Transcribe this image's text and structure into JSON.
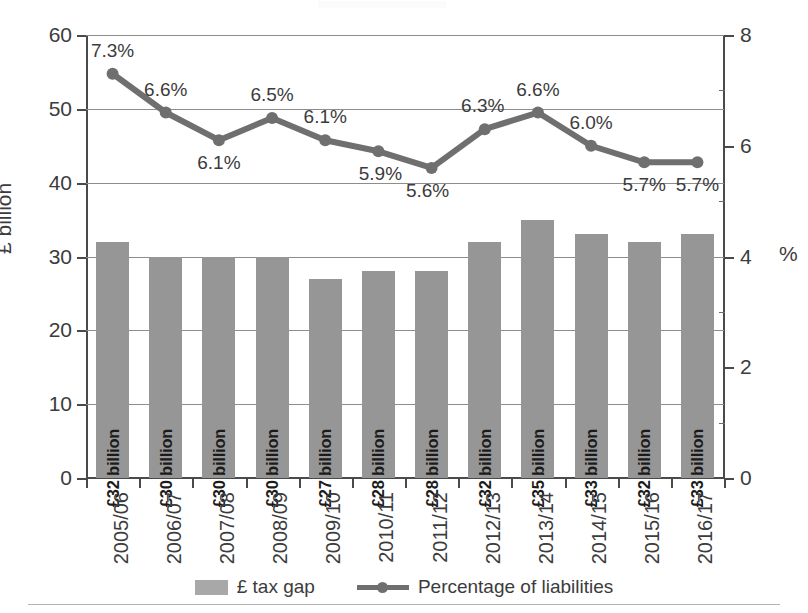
{
  "axes": {
    "left_title": "£ billion",
    "right_title": "%",
    "left_ticks": [
      "0",
      "10",
      "20",
      "30",
      "40",
      "50",
      "60"
    ],
    "right_ticks": [
      "0",
      "2",
      "4",
      "6",
      "8"
    ]
  },
  "legend": {
    "items": [
      {
        "label": "£ tax gap",
        "type": "bar",
        "color": "#a8a8a8"
      },
      {
        "label": "Percentage of liabilities",
        "type": "line",
        "color": "#6f6f6f"
      }
    ]
  },
  "chart_data": {
    "type": "bar",
    "title": "",
    "subtitle": "",
    "xlabel": "",
    "ylabel": "£ billion",
    "y2label": "%",
    "ylim": [
      0,
      60
    ],
    "y2lim": [
      0,
      8
    ],
    "yticks": [
      0,
      10,
      20,
      30,
      40,
      50,
      60
    ],
    "y2ticks": [
      0,
      2,
      4,
      6,
      8
    ],
    "y2minorticks": [
      1,
      3,
      5,
      7
    ],
    "grid": true,
    "legend_position": "bottom",
    "categories": [
      "2005/06",
      "2006/07",
      "2007/08",
      "2008/09",
      "2009/10",
      "2010/11",
      "2011/12",
      "2012/13",
      "2013/14",
      "2014/15",
      "2015/16",
      "2016/17"
    ],
    "series": [
      {
        "name": "£ tax gap",
        "type": "bar",
        "axis": "left",
        "unit": "£ billion",
        "color": "#969696",
        "values": [
          32,
          30,
          30,
          30,
          27,
          28,
          28,
          32,
          35,
          33,
          32,
          33
        ],
        "data_labels": [
          "£32 billion",
          "£30 billion",
          "£30 billion",
          "£30 billion",
          "£27 billion",
          "£28 billion",
          "£28 billion",
          "£32 billion",
          "£35 billion",
          "£33 billion",
          "£32 billion",
          "£33 billion"
        ]
      },
      {
        "name": "Percentage of liabilities",
        "type": "line",
        "axis": "right",
        "unit": "%",
        "color": "#6f6f6f",
        "values": [
          7.3,
          6.6,
          6.1,
          6.5,
          6.1,
          5.9,
          5.6,
          6.3,
          6.6,
          6.0,
          5.7,
          5.7
        ],
        "data_labels": [
          "7.3%",
          "6.6%",
          "6.1%",
          "6.5%",
          "6.1%",
          "5.9%",
          "5.6%",
          "6.3%",
          "6.6%",
          "6.0%",
          "5.7%",
          "5.7%"
        ]
      }
    ]
  }
}
